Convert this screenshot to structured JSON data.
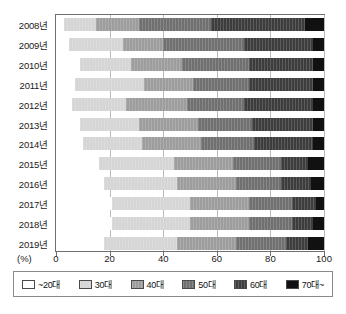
{
  "chart_data": {
    "type": "bar",
    "orientation": "horizontal",
    "stacked": true,
    "stack_mode": "percent",
    "title": "",
    "xlabel": "(%)",
    "ylabel": "",
    "xlim": [
      0,
      100
    ],
    "xticks": [
      0,
      20,
      40,
      60,
      80,
      100
    ],
    "grid": true,
    "legend_position": "bottom",
    "categories": [
      "2008년",
      "2009년",
      "2010년",
      "2011년",
      "2012년",
      "2013년",
      "2014년",
      "2015년",
      "2016년",
      "2017년",
      "2018년",
      "2019년"
    ],
    "series": [
      {
        "name": "~20대",
        "color": "#ffffff",
        "values": [
          3,
          5,
          9,
          7,
          6,
          9,
          10,
          16,
          18,
          21,
          21,
          18
        ]
      },
      {
        "name": "30대",
        "color": "#d5d5d5",
        "values": [
          12,
          20,
          19,
          26,
          20,
          22,
          22,
          28,
          27,
          29,
          29,
          27
        ]
      },
      {
        "name": "40대",
        "color": "#9d9d9d",
        "values": [
          16,
          15,
          19,
          18,
          23,
          22,
          22,
          22,
          22,
          22,
          22,
          22
        ]
      },
      {
        "name": "50대",
        "color": "#707070",
        "values": [
          27,
          30,
          25,
          21,
          21,
          20,
          20,
          18,
          17,
          16,
          16,
          19
        ]
      },
      {
        "name": "60대",
        "color": "#3d3d3d",
        "values": [
          35,
          26,
          24,
          24,
          26,
          23,
          22,
          10,
          11,
          9,
          8,
          8
        ]
      },
      {
        "name": "70대~",
        "color": "#111111",
        "values": [
          7,
          4,
          4,
          4,
          4,
          4,
          4,
          6,
          5,
          3,
          4,
          6
        ]
      }
    ]
  },
  "axis": {
    "unit": "(%)",
    "tick_labels": [
      "0",
      "20",
      "40",
      "60",
      "80",
      "100"
    ]
  },
  "legend": {
    "items": [
      {
        "label": "~20대",
        "color": "#ffffff"
      },
      {
        "label": "30대",
        "color": "#d5d5d5"
      },
      {
        "label": "40대",
        "color": "#9d9d9d"
      },
      {
        "label": "50대",
        "color": "#707070"
      },
      {
        "label": "60대",
        "color": "#3d3d3d"
      },
      {
        "label": "70대~",
        "color": "#111111"
      }
    ]
  }
}
